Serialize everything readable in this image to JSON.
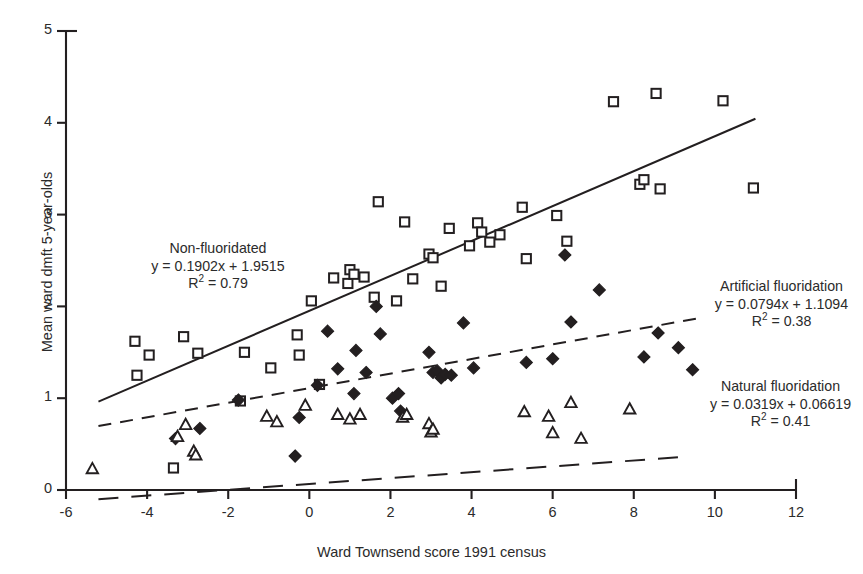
{
  "chart_data": {
    "type": "scatter",
    "title": "",
    "xlabel": "Ward Townsend score 1991 census",
    "ylabel": "Mean ward dmft 5-year-olds",
    "xlim": [
      -6,
      12
    ],
    "ylim": [
      0,
      5
    ],
    "xticks": [
      "-6",
      "-4",
      "-2",
      "0",
      "2",
      "4",
      "6",
      "8",
      "10",
      "12"
    ],
    "xtick_values": [
      -6,
      -4,
      -2,
      0,
      2,
      4,
      6,
      8,
      10,
      12
    ],
    "yticks": [
      "0",
      "1",
      "2",
      "3",
      "4",
      "5"
    ],
    "ytick_values": [
      0,
      1,
      2,
      3,
      4,
      5
    ],
    "grid": false,
    "legend": "none",
    "series": [
      {
        "name": "Non-fluoridated",
        "marker": "open-square",
        "color": "#231f20",
        "equation": "y = 0.1902x + 1.9515",
        "slope": 0.1902,
        "intercept": 1.9515,
        "r_squared": 0.79,
        "r_squared_label": "R² = 0.79",
        "trendline_style": "solid",
        "trendline_x": [
          -5.2,
          11.0
        ],
        "points": [
          [
            -4.3,
            1.62
          ],
          [
            -4.25,
            1.25
          ],
          [
            -3.95,
            1.47
          ],
          [
            -3.35,
            0.24
          ],
          [
            -3.1,
            1.67
          ],
          [
            -2.75,
            1.49
          ],
          [
            -1.7,
            0.97
          ],
          [
            -1.6,
            1.5
          ],
          [
            -0.95,
            1.33
          ],
          [
            -0.3,
            1.69
          ],
          [
            -0.25,
            1.47
          ],
          [
            0.05,
            2.06
          ],
          [
            0.25,
            1.15
          ],
          [
            0.6,
            2.31
          ],
          [
            0.95,
            2.25
          ],
          [
            1.0,
            2.4
          ],
          [
            1.1,
            2.35
          ],
          [
            1.35,
            2.32
          ],
          [
            1.6,
            2.1
          ],
          [
            1.7,
            3.14
          ],
          [
            2.15,
            2.06
          ],
          [
            2.35,
            2.92
          ],
          [
            2.55,
            2.3
          ],
          [
            2.95,
            2.57
          ],
          [
            3.05,
            2.53
          ],
          [
            3.25,
            2.22
          ],
          [
            3.45,
            2.85
          ],
          [
            3.95,
            2.66
          ],
          [
            4.15,
            2.91
          ],
          [
            4.25,
            2.81
          ],
          [
            4.45,
            2.7
          ],
          [
            4.7,
            2.78
          ],
          [
            5.25,
            3.08
          ],
          [
            5.35,
            2.52
          ],
          [
            6.1,
            2.99
          ],
          [
            6.35,
            2.71
          ],
          [
            7.5,
            4.23
          ],
          [
            8.15,
            3.33
          ],
          [
            8.25,
            3.38
          ],
          [
            8.55,
            4.32
          ],
          [
            8.65,
            3.28
          ],
          [
            10.2,
            4.24
          ],
          [
            10.95,
            3.29
          ]
        ]
      },
      {
        "name": "Artificial fluoridation",
        "marker": "filled-diamond",
        "color": "#231f20",
        "equation": "y = 0.0794x + 1.1094",
        "slope": 0.0794,
        "intercept": 1.1094,
        "r_squared": 0.38,
        "r_squared_label": "R² = 0.38",
        "trendline_style": "dashed",
        "trendline_x": [
          -5.2,
          9.6
        ],
        "points": [
          [
            -3.3,
            0.56
          ],
          [
            -2.7,
            0.67
          ],
          [
            -1.75,
            0.98
          ],
          [
            -0.35,
            0.37
          ],
          [
            -0.25,
            0.79
          ],
          [
            0.2,
            1.14
          ],
          [
            0.45,
            1.73
          ],
          [
            0.7,
            1.32
          ],
          [
            1.1,
            1.05
          ],
          [
            1.15,
            1.52
          ],
          [
            1.4,
            1.28
          ],
          [
            1.65,
            2.0
          ],
          [
            1.75,
            1.7
          ],
          [
            2.05,
            1.0
          ],
          [
            2.2,
            1.05
          ],
          [
            2.25,
            0.86
          ],
          [
            2.95,
            1.5
          ],
          [
            3.05,
            1.28
          ],
          [
            3.15,
            1.3
          ],
          [
            3.25,
            1.22
          ],
          [
            3.35,
            1.26
          ],
          [
            3.5,
            1.25
          ],
          [
            3.8,
            1.82
          ],
          [
            4.05,
            1.33
          ],
          [
            5.35,
            1.39
          ],
          [
            6.0,
            1.43
          ],
          [
            6.3,
            2.56
          ],
          [
            6.45,
            1.83
          ],
          [
            7.15,
            2.18
          ],
          [
            8.25,
            1.45
          ],
          [
            8.6,
            1.71
          ],
          [
            9.1,
            1.55
          ],
          [
            9.45,
            1.31
          ]
        ]
      },
      {
        "name": "Natural fluoridation",
        "marker": "open-triangle",
        "color": "#231f20",
        "equation": "y = 0.0319x + 0.06619",
        "slope": 0.0319,
        "intercept": 0.06619,
        "r_squared": 0.41,
        "r_squared_label": "R² = 0.41",
        "trendline_style": "dashed-long",
        "trendline_x": [
          -5.2,
          9.4
        ],
        "points": [
          [
            -5.35,
            0.23
          ],
          [
            -3.25,
            0.58
          ],
          [
            -3.05,
            0.71
          ],
          [
            -2.85,
            0.42
          ],
          [
            -2.8,
            0.38
          ],
          [
            -1.05,
            0.8
          ],
          [
            -0.8,
            0.74
          ],
          [
            -0.1,
            0.92
          ],
          [
            0.7,
            0.82
          ],
          [
            1.0,
            0.77
          ],
          [
            1.25,
            0.82
          ],
          [
            2.3,
            0.79
          ],
          [
            2.4,
            0.82
          ],
          [
            2.95,
            0.72
          ],
          [
            3.0,
            0.63
          ],
          [
            3.05,
            0.66
          ],
          [
            5.3,
            0.85
          ],
          [
            5.9,
            0.8
          ],
          [
            6.0,
            0.62
          ],
          [
            6.45,
            0.95
          ],
          [
            6.7,
            0.56
          ],
          [
            7.9,
            0.88
          ]
        ]
      }
    ],
    "annotations": [
      {
        "id": "non-fluoridated",
        "title": "Non-fluoridated",
        "equation": "y = 0.1902x + 1.9515",
        "r_squared_prefix": "R",
        "r_squared_suffix": " = 0.79"
      },
      {
        "id": "artificial-fluoridation",
        "title": "Artificial fluoridation",
        "equation": "y = 0.0794x + 1.1094",
        "r_squared_prefix": "R",
        "r_squared_suffix": " = 0.38"
      },
      {
        "id": "natural-fluoridation",
        "title": "Natural fluoridation",
        "equation": "y = 0.0319x + 0.06619",
        "r_squared_prefix": "R",
        "r_squared_suffix": " = 0.41"
      }
    ]
  }
}
